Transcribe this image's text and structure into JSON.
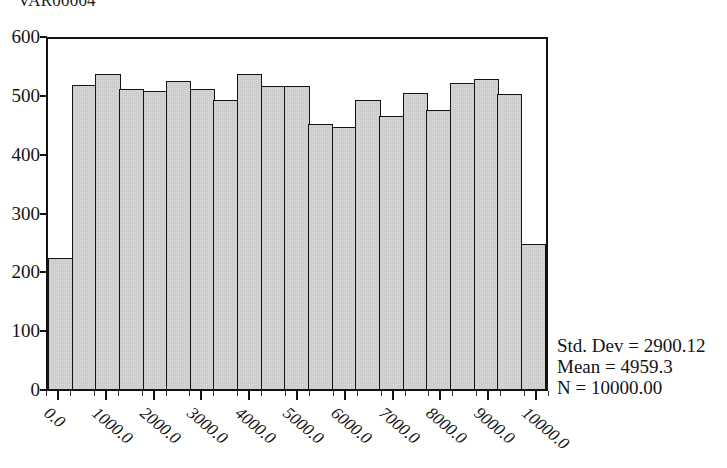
{
  "chart_data": {
    "type": "bar",
    "title": "VAR00004",
    "xlabel": "",
    "ylabel": "",
    "ylim": [
      0,
      600
    ],
    "xlim": [
      -250,
      10250
    ],
    "grid": false,
    "legend_position": "none",
    "bin_width": 500,
    "categories": [
      "0",
      "500",
      "1000",
      "1500",
      "2000",
      "2500",
      "3000",
      "3500",
      "4000",
      "4500",
      "5000",
      "5500",
      "6000",
      "6500",
      "7000",
      "7500",
      "8000",
      "8500",
      "9000",
      "9500",
      "10000"
    ],
    "values": [
      225,
      522,
      540,
      514,
      511,
      529,
      515,
      496,
      540,
      520,
      520,
      455,
      449,
      496,
      468,
      507,
      479,
      524,
      531,
      506,
      250
    ],
    "series": [
      {
        "name": "VAR00004",
        "values": [
          225,
          522,
          540,
          514,
          511,
          529,
          515,
          496,
          540,
          520,
          520,
          455,
          449,
          496,
          468,
          507,
          479,
          524,
          531,
          506,
          250
        ]
      }
    ],
    "y_ticks": [
      0,
      100,
      200,
      300,
      400,
      500,
      600
    ],
    "y_tick_labels": [
      "0",
      "100",
      "200",
      "300",
      "400",
      "500",
      "600"
    ],
    "x_tick_labels": [
      "0.0",
      "1000.0",
      "2000.0",
      "3000.0",
      "4000.0",
      "5000.0",
      "6000.0",
      "7000.0",
      "8000.0",
      "9000.0",
      "10000.0"
    ],
    "x_tick_values": [
      0,
      1000,
      2000,
      3000,
      4000,
      5000,
      6000,
      7000,
      8000,
      9000,
      10000
    ],
    "annotations": {
      "std_dev": "Std. Dev = 2900.12",
      "mean": "Mean = 4959.3",
      "n": "N = 10000.00"
    },
    "colors": {
      "bar_fill": "#d9d9d9",
      "bar_border": "#141414",
      "axis": "#111111",
      "text": "#141414",
      "background": "#ffffff"
    }
  }
}
